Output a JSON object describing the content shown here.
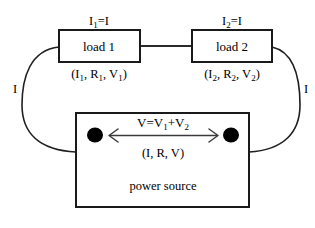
{
  "diagram": {
    "background_color": "#ffffff",
    "line_color": "#1a1a1a",
    "text_color": "#000000",
    "loads": [
      {
        "id": "load-1",
        "box_label": "load 1",
        "current_label_main": "I",
        "current_label_sub": "1",
        "current_label_rest": "=I",
        "current_label_full": "I1=I",
        "triple_open": "(I",
        "triple_sub1": "1",
        "triple_mid1": ", R",
        "triple_sub2": "1",
        "triple_mid2": ", V",
        "triple_sub3": "1",
        "triple_close": ")",
        "triple_full": "(I1, R1, V1)"
      },
      {
        "id": "load-2",
        "box_label": "load 2",
        "current_label_main": "I",
        "current_label_sub": "2",
        "current_label_rest": "=I",
        "current_label_full": "I2=I",
        "triple_open": "(I",
        "triple_sub1": "2",
        "triple_mid1": ", R",
        "triple_sub2": "2",
        "triple_mid2": ", V",
        "triple_sub3": "2",
        "triple_close": ")",
        "triple_full": "(I2, R2, V2)"
      }
    ],
    "power_source": {
      "id": "power-source",
      "box_label": "power source",
      "voltage_open": "V=V",
      "voltage_sub1": "1",
      "voltage_plus": "+V",
      "voltage_sub2": "2",
      "voltage_full": "V=V1+V2",
      "triple_label": "(I, R, V)",
      "terminal_left_name": "terminal-left",
      "terminal_right_name": "terminal-right"
    },
    "current_arrows": {
      "left_label": "I",
      "right_label": "I"
    }
  }
}
